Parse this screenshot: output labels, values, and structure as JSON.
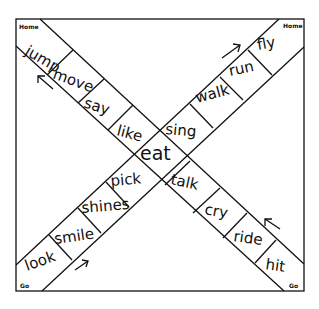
{
  "board": {
    "corners": {
      "top_left": "Home",
      "top_right": "Home",
      "bottom_left": "Go",
      "bottom_right": "Go"
    },
    "path_top_left_to_bottom_right": [
      "jump",
      "move",
      "say",
      "like",
      "eat",
      "talk",
      "cry",
      "ride",
      "hit"
    ],
    "path_bottom_left_to_top_right": [
      "look",
      "smile",
      "shines",
      "pick",
      "eat",
      "sing",
      "walk",
      "run",
      "fly"
    ],
    "center": "eat",
    "cells": {
      "jump": "jump",
      "move": "move",
      "say": "say",
      "like": "like",
      "eat": "eat",
      "talk": "talk",
      "cry": "cry",
      "ride": "ride",
      "hit": "hit",
      "look": "look",
      "smile": "smile",
      "shines": "shines",
      "pick": "pick",
      "sing": "sing",
      "walk": "walk",
      "run": "run",
      "fly": "fly"
    },
    "arrows": [
      {
        "location": "top-left",
        "direction": "up-left"
      },
      {
        "location": "top-right",
        "direction": "up-right"
      },
      {
        "location": "bottom-left",
        "direction": "up-right"
      },
      {
        "location": "bottom-right",
        "direction": "up-left"
      }
    ],
    "colors": {
      "ink": "#111111",
      "paper": "#ffffff"
    }
  }
}
